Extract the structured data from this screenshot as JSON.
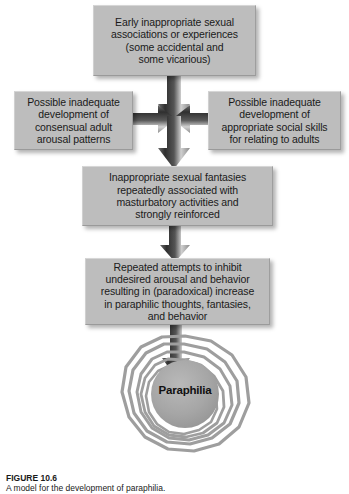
{
  "figure": {
    "caption_label": "FIGURE 10.6",
    "caption_text": "A model for the development of paraphilia.",
    "colors": {
      "box_fill": "#bdbdbd",
      "box_text": "#1a1a1a",
      "arrow_dark": "#3c3c3c",
      "arrow_light": "#e8e8e8",
      "spiral_ring": "#9e9e9e",
      "spiral_core": "#a8a8a8",
      "background": "#ffffff"
    }
  },
  "nodes": {
    "top": {
      "id": "early-associations",
      "text": "Early inappropriate sexual\nassociations or experiences\n(some accidental and\nsome vicarious)"
    },
    "left": {
      "id": "inadequate-arousal",
      "text": "Possible inadequate\ndevelopment of\nconsensual adult\narousal patterns"
    },
    "right": {
      "id": "inadequate-social-skills",
      "text": "Possible inadequate\ndevelopment of\nappropriate social skills\nfor relating to adults"
    },
    "fantasy": {
      "id": "inappropriate-fantasies",
      "text": "Inappropriate sexual fantasies\nrepeatedly associated with\nmasturbatory activities and\nstrongly reinforced"
    },
    "inhibit": {
      "id": "repeated-attempts-inhibit",
      "text": "Repeated attempts to inhibit\nundesired arousal and behavior\nresulting in (paradoxical) increase\nin paraphilic thoughts, fantasies,\nand behavior"
    },
    "outcome": {
      "id": "paraphilia-outcome",
      "label": "Paraphilia"
    }
  },
  "arrows": [
    {
      "id": "arrow-top-to-center",
      "from": "early-associations",
      "to": "convergence-point",
      "direction": "down"
    },
    {
      "id": "arrow-left-to-center",
      "from": "inadequate-arousal",
      "to": "convergence-point",
      "direction": "right"
    },
    {
      "id": "arrow-right-to-center",
      "from": "inadequate-social-skills",
      "to": "convergence-point",
      "direction": "left"
    },
    {
      "id": "arrow-center-to-fantasy",
      "from": "convergence-point",
      "to": "inappropriate-fantasies",
      "direction": "down"
    },
    {
      "id": "arrow-fantasy-to-inhibit",
      "from": "inappropriate-fantasies",
      "to": "repeated-attempts-inhibit",
      "direction": "down"
    },
    {
      "id": "arrow-inhibit-to-paraphilia",
      "from": "repeated-attempts-inhibit",
      "to": "paraphilia-outcome",
      "direction": "down"
    }
  ]
}
